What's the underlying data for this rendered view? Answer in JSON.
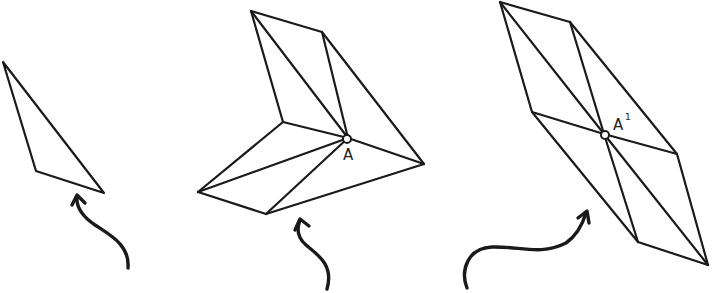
{
  "figure": {
    "panels": [
      {
        "name": "original-triangle",
        "label": ""
      },
      {
        "name": "partial-rotation",
        "label": "A"
      },
      {
        "name": "full-rotation",
        "label": "A",
        "label_sup": "1"
      }
    ],
    "colors": {
      "stroke": "#1a1a1a",
      "background": "#ffffff"
    }
  }
}
